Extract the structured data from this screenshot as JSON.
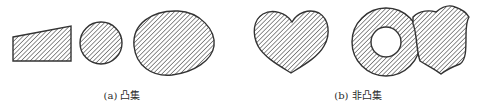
{
  "figure": {
    "panels": [
      {
        "id": "a",
        "caption": "(a) 凸集",
        "shapes": [
          "trapezoid",
          "circle",
          "egg"
        ]
      },
      {
        "id": "b",
        "caption": "(b) 非凸集",
        "shapes": [
          "heart",
          "annulus",
          "shield"
        ]
      }
    ],
    "style": {
      "fill_pattern": "diagonal-hatch",
      "stroke_color": "#333333",
      "hatch_color": "#555555",
      "background": "#ffffff"
    }
  }
}
